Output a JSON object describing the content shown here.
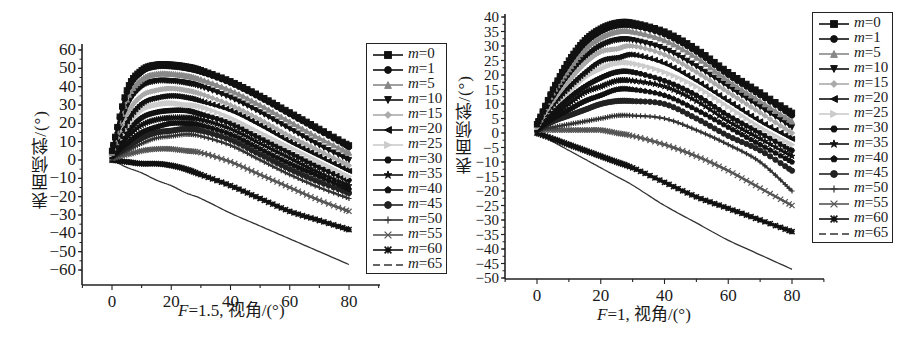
{
  "panels": [
    {
      "id": "left",
      "ylabel": "表面倾斜/(°)",
      "xlabel_var": "F",
      "xlabel_rest": "=1.5, 视角/(°)",
      "yticks": [
        60,
        50,
        40,
        30,
        20,
        10,
        0,
        -10,
        -20,
        -30,
        -40,
        -50,
        -60
      ],
      "xticks": [
        0,
        20,
        40,
        60,
        80
      ]
    },
    {
      "id": "right",
      "ylabel": "表面倾斜/(°)",
      "xlabel_var": "F",
      "xlabel_rest": "=1, 视角/(°)",
      "yticks": [
        40,
        35,
        30,
        25,
        20,
        15,
        10,
        5,
        0,
        -5,
        -10,
        -15,
        -20,
        -25,
        -30,
        -35,
        -40,
        -45,
        -50
      ],
      "xticks": [
        0,
        20,
        40,
        60,
        80
      ]
    }
  ],
  "legend": [
    {
      "var": "m",
      "eq": "=0",
      "marker": "square",
      "color": "#111111"
    },
    {
      "var": "m",
      "eq": "=1",
      "marker": "circle",
      "color": "#111111"
    },
    {
      "var": "m",
      "eq": "=5",
      "marker": "triangle-up",
      "color": "#888888"
    },
    {
      "var": "m",
      "eq": "=10",
      "marker": "triangle-down",
      "color": "#111111"
    },
    {
      "var": "m",
      "eq": "=15",
      "marker": "diamond",
      "color": "#aaaaaa"
    },
    {
      "var": "m",
      "eq": "=20",
      "marker": "triangle-left",
      "color": "#111111"
    },
    {
      "var": "m",
      "eq": "=25",
      "marker": "triangle-right",
      "color": "#cccccc"
    },
    {
      "var": "m",
      "eq": "=30",
      "marker": "hexagon",
      "color": "#111111"
    },
    {
      "var": "m",
      "eq": "=35",
      "marker": "star",
      "color": "#111111"
    },
    {
      "var": "m",
      "eq": "=40",
      "marker": "pentagon",
      "color": "#111111"
    },
    {
      "var": "m",
      "eq": "=45",
      "marker": "circle",
      "color": "#222222"
    },
    {
      "var": "m",
      "eq": "=50",
      "marker": "plus",
      "color": "#333333"
    },
    {
      "var": "m",
      "eq": "=55",
      "marker": "cross",
      "color": "#555555"
    },
    {
      "var": "m",
      "eq": "=60",
      "marker": "asterisk",
      "color": "#111111"
    },
    {
      "var": "m",
      "eq": "=65",
      "marker": "dash",
      "color": "#333333"
    }
  ],
  "chart_data": [
    {
      "type": "line",
      "title": "",
      "xlabel": "F=1.5, 视角/(°)",
      "ylabel": "表面倾斜/(°)",
      "xlim": [
        -8,
        90
      ],
      "ylim": [
        -64,
        64
      ],
      "xticks": [
        0,
        20,
        40,
        60,
        80
      ],
      "yticks": [
        -60,
        -50,
        -40,
        -30,
        -20,
        -10,
        0,
        10,
        20,
        30,
        40,
        50,
        60
      ],
      "grid": false,
      "legend_position": "right",
      "x": [
        0,
        5,
        10,
        15,
        20,
        25,
        30,
        40,
        50,
        60,
        70,
        80
      ],
      "series": [
        {
          "name": "m=0",
          "values": [
            5,
            38,
            49,
            52,
            52,
            51,
            49,
            43,
            35,
            26,
            17,
            8
          ]
        },
        {
          "name": "m=1",
          "values": [
            5,
            37,
            48,
            51,
            51,
            50,
            48,
            42,
            34,
            25,
            16,
            7
          ]
        },
        {
          "name": "m=5",
          "values": [
            4,
            33,
            44,
            47,
            47,
            46,
            44,
            38,
            30,
            21,
            12,
            4
          ]
        },
        {
          "name": "m=10",
          "values": [
            4,
            29,
            40,
            43,
            43,
            42,
            40,
            34,
            26,
            17,
            8,
            0
          ]
        },
        {
          "name": "m=15",
          "values": [
            4,
            25,
            35,
            38,
            39,
            38,
            36,
            30,
            22,
            13,
            5,
            -3
          ]
        },
        {
          "name": "m=20",
          "values": [
            3,
            21,
            31,
            34,
            35,
            34,
            32,
            27,
            19,
            10,
            2,
            -6
          ]
        },
        {
          "name": "m=25",
          "values": [
            3,
            18,
            27,
            30,
            31,
            30,
            29,
            23,
            15,
            7,
            -1,
            -9
          ]
        },
        {
          "name": "m=30",
          "values": [
            3,
            15,
            23,
            26,
            27,
            27,
            25,
            20,
            12,
            4,
            -4,
            -11
          ]
        },
        {
          "name": "m=35",
          "values": [
            2,
            12,
            19,
            22,
            23,
            23,
            22,
            17,
            9,
            1,
            -7,
            -14
          ]
        },
        {
          "name": "m=40",
          "values": [
            2,
            9,
            15,
            18,
            20,
            20,
            19,
            14,
            6,
            -2,
            -9,
            -16
          ]
        },
        {
          "name": "m=45",
          "values": [
            2,
            7,
            12,
            15,
            16,
            17,
            16,
            11,
            3,
            -5,
            -12,
            -18
          ]
        },
        {
          "name": "m=50",
          "values": [
            1,
            5,
            9,
            12,
            13,
            14,
            13,
            8,
            0,
            -8,
            -15,
            -21
          ]
        },
        {
          "name": "m=55",
          "values": [
            1,
            3,
            5,
            6,
            6,
            5,
            4,
            -1,
            -8,
            -15,
            -22,
            -28
          ]
        },
        {
          "name": "m=60",
          "values": [
            0,
            -1,
            -2,
            -2,
            -3,
            -5,
            -8,
            -14,
            -21,
            -28,
            -33,
            -38
          ]
        },
        {
          "name": "m=65",
          "values": [
            0,
            -4,
            -7,
            -11,
            -14,
            -18,
            -21,
            -29,
            -36,
            -43,
            -50,
            -57
          ]
        }
      ]
    },
    {
      "type": "line",
      "title": "",
      "xlabel": "F=1, 视角/(°)",
      "ylabel": "表面倾斜/(°)",
      "xlim": [
        -8,
        90
      ],
      "ylim": [
        -50,
        41
      ],
      "xticks": [
        0,
        20,
        40,
        60,
        80
      ],
      "yticks": [
        -50,
        -45,
        -40,
        -35,
        -30,
        -25,
        -20,
        -15,
        -10,
        -5,
        0,
        5,
        10,
        15,
        20,
        25,
        30,
        35,
        40
      ],
      "grid": false,
      "legend_position": "upper right",
      "x": [
        0,
        5,
        10,
        15,
        20,
        25,
        30,
        40,
        50,
        60,
        70,
        80
      ],
      "series": [
        {
          "name": "m=0",
          "values": [
            3,
            15,
            25,
            32,
            36,
            38,
            38,
            35,
            29,
            21,
            14,
            7
          ]
        },
        {
          "name": "m=1",
          "values": [
            3,
            15,
            24,
            31,
            35,
            37,
            37,
            34,
            28,
            20,
            13,
            6
          ]
        },
        {
          "name": "m=5",
          "values": [
            3,
            14,
            22,
            29,
            33,
            35,
            35,
            32,
            26,
            18,
            11,
            4
          ]
        },
        {
          "name": "m=10",
          "values": [
            3,
            12,
            20,
            26,
            30,
            32,
            32,
            29,
            23,
            16,
            9,
            2
          ]
        },
        {
          "name": "m=15",
          "values": [
            2,
            11,
            18,
            24,
            28,
            29,
            30,
            27,
            21,
            14,
            7,
            0
          ]
        },
        {
          "name": "m=20",
          "values": [
            2,
            10,
            16,
            21,
            25,
            26,
            27,
            24,
            18,
            11,
            4,
            -2
          ]
        },
        {
          "name": "m=25",
          "values": [
            2,
            9,
            14,
            19,
            22,
            24,
            24,
            21,
            16,
            9,
            2,
            -4
          ]
        },
        {
          "name": "m=30",
          "values": [
            2,
            7,
            12,
            16,
            19,
            21,
            21,
            18,
            13,
            6,
            0,
            -6
          ]
        },
        {
          "name": "m=35",
          "values": [
            2,
            6,
            10,
            14,
            16,
            18,
            18,
            16,
            11,
            4,
            -2,
            -8
          ]
        },
        {
          "name": "m=40",
          "values": [
            1,
            5,
            8,
            11,
            13,
            15,
            15,
            13,
            8,
            2,
            -4,
            -10
          ]
        },
        {
          "name": "m=45",
          "values": [
            1,
            4,
            6,
            8,
            10,
            11,
            11,
            10,
            5,
            -1,
            -6,
            -13
          ]
        },
        {
          "name": "m=50",
          "values": [
            1,
            2,
            3,
            4,
            5,
            6,
            6,
            5,
            1,
            -4,
            -10,
            -20
          ]
        },
        {
          "name": "m=55",
          "values": [
            1,
            1,
            1,
            1,
            1,
            0,
            -1,
            -4,
            -8,
            -13,
            -19,
            -25
          ]
        },
        {
          "name": "m=60",
          "values": [
            0,
            -2,
            -4,
            -6,
            -8,
            -10,
            -12,
            -17,
            -22,
            -26,
            -30,
            -34
          ]
        },
        {
          "name": "m=65",
          "values": [
            0,
            -3,
            -6,
            -9,
            -12,
            -15,
            -18,
            -25,
            -31,
            -37,
            -42,
            -47
          ]
        }
      ]
    }
  ]
}
